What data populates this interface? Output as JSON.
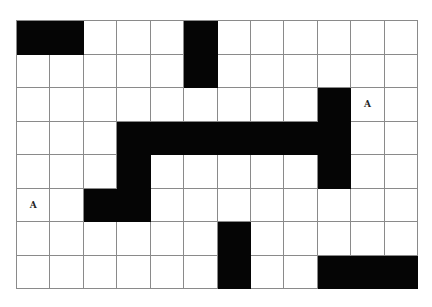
{
  "grid": {
    "columns": 12,
    "rows": 8,
    "colors": {
      "filled": "#050505",
      "empty": "#ffffff",
      "line": "#8a8a8a"
    },
    "filled_cells": [
      [
        0,
        0
      ],
      [
        1,
        0
      ],
      [
        5,
        0
      ],
      [
        5,
        1
      ],
      [
        9,
        2
      ],
      [
        3,
        3
      ],
      [
        4,
        3
      ],
      [
        5,
        3
      ],
      [
        6,
        3
      ],
      [
        7,
        3
      ],
      [
        8,
        3
      ],
      [
        9,
        3
      ],
      [
        3,
        4
      ],
      [
        9,
        4
      ],
      [
        2,
        5
      ],
      [
        3,
        5
      ],
      [
        6,
        6
      ],
      [
        6,
        7
      ],
      [
        9,
        7
      ],
      [
        10,
        7
      ],
      [
        11,
        7
      ]
    ],
    "labels": [
      {
        "col": 10,
        "row": 2,
        "text": "A"
      },
      {
        "col": 0,
        "row": 5,
        "text": "A"
      }
    ]
  }
}
